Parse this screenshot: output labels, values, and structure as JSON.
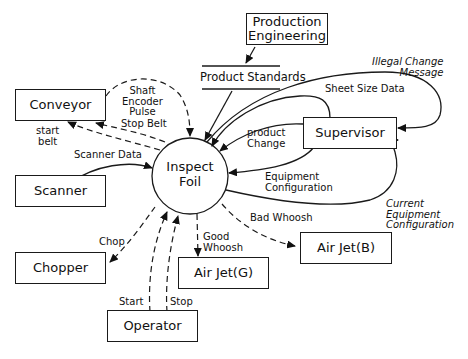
{
  "diagram": {
    "type": "data-flow-diagram",
    "process": {
      "name": "Inspect Foil",
      "line1": "Inspect",
      "line2": "Foil"
    },
    "data_store": {
      "name": "Product Standards"
    },
    "entities": {
      "production_engineering": {
        "line1": "Production",
        "line2": "Engineering"
      },
      "conveyor": "Conveyor",
      "scanner": "Scanner",
      "chopper": "Chopper",
      "operator": "Operator",
      "supervisor": "Supervisor",
      "airjet_g": "Air Jet(G)",
      "airjet_b": "Air Jet(B)"
    },
    "flows": {
      "shaft_encoder_pulse": {
        "line1": "Shaft",
        "line2": "Encoder",
        "line3": "Pulse"
      },
      "stop_belt": "Stop Belt",
      "start_belt": {
        "line1": "start",
        "line2": "belt"
      },
      "scanner_data": "Scanner Data",
      "chop": "Chop",
      "start": "Start",
      "stop": "Stop",
      "good_whoosh": {
        "line1": "Good",
        "line2": "Whoosh"
      },
      "bad_whoosh": "Bad Whoosh",
      "illegal_change_message": {
        "line1": "Illegal Change",
        "line2": "Message"
      },
      "sheet_size_data": "Sheet Size Data",
      "product_change": {
        "line1": "product",
        "line2": "Change"
      },
      "equipment_configuration": {
        "line1": "Equipment",
        "line2": "Configuration"
      },
      "current_equipment_configuration": {
        "line1": "Current",
        "line2": "Equipment",
        "line3": "Configuration"
      }
    }
  }
}
